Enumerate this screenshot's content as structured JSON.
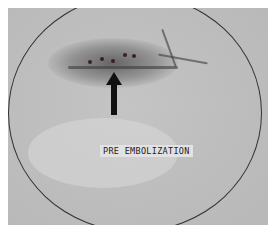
{
  "image": {
    "kind": "angiogram",
    "colors": {
      "background": "#ffffff",
      "field": "#bdbdbd",
      "contrast": "#3a3a3a",
      "arrow": "#111111"
    }
  },
  "annotation": {
    "label": "PRE EMBOLIZATION",
    "arrow": "arrow-up-icon"
  }
}
